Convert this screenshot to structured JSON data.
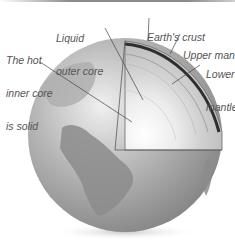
{
  "diagram": {
    "labels": {
      "liquid_outer_core": [
        "Liquid",
        "outer core"
      ],
      "inner_core": [
        "The hot",
        "inner core",
        "is solid"
      ],
      "earths_crust": [
        "Earth's crust"
      ],
      "upper_mantle": [
        "Upper mantle"
      ],
      "lower_mantle": [
        "Lower",
        "mantle"
      ]
    },
    "colors": {
      "globe_base": "#9a9a9a",
      "continent": "#7a7a7a",
      "crust": "#3a3a3a",
      "mantle": "#b5b5b5",
      "core": "#e8e8e8",
      "label_text": "#555555",
      "leader_line": "#444444"
    }
  }
}
